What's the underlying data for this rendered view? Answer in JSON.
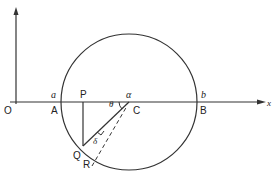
{
  "diagram": {
    "colors": {
      "stroke": "#333333",
      "text": "#222222",
      "background": "#ffffff"
    },
    "axes": {
      "x_label": "x",
      "origin_label": "O"
    },
    "circle": {
      "center_label": "C",
      "center_coord_label": "α"
    },
    "points": {
      "A": "A",
      "A_coord": "a",
      "B": "B",
      "B_coord": "b",
      "P": "P",
      "Q": "Q",
      "R": "R"
    },
    "angles": {
      "theta": "θ",
      "delta": "δ"
    }
  }
}
